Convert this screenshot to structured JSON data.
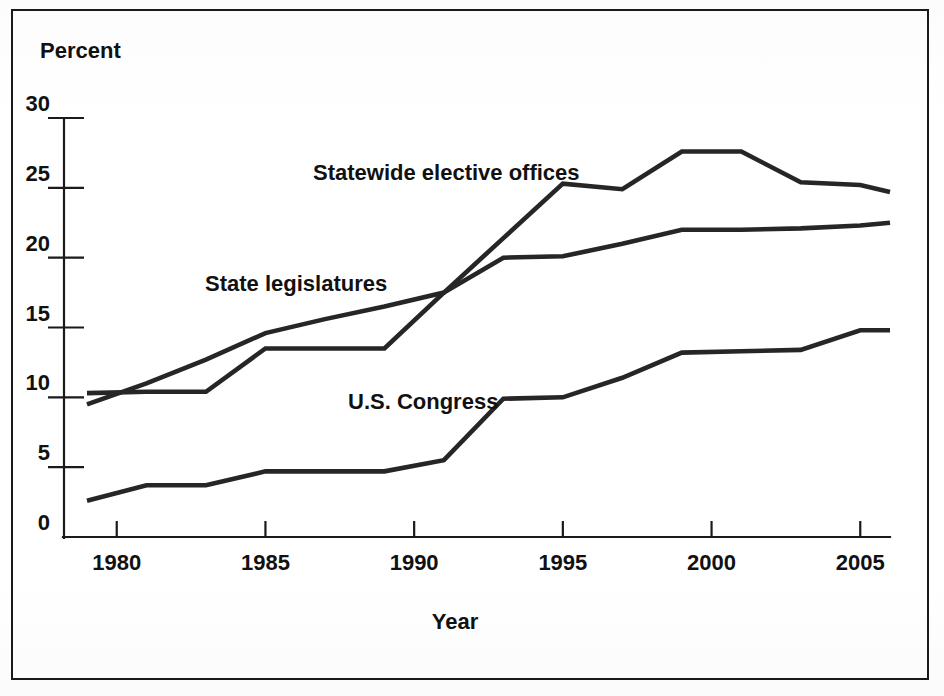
{
  "figure": {
    "y_axis_title": "Percent",
    "x_axis_title": "Year",
    "border_color": "#1a1a1a",
    "line_color": "#262626",
    "background_color": "#ffffff"
  },
  "y_ticks": [
    "0",
    "5",
    "10",
    "15",
    "20",
    "25",
    "30"
  ],
  "x_ticks": [
    "1980",
    "1985",
    "1990",
    "1995",
    "2000",
    "2005"
  ],
  "series_labels": {
    "statewide": "Statewide elective offices",
    "legislatures": "State legislatures",
    "congress": "U.S. Congress"
  },
  "chart_data": {
    "type": "line",
    "title": "",
    "subtitle": "",
    "xlabel": "Year",
    "ylabel": "Percent",
    "xlim": [
      1979,
      2006
    ],
    "ylim": [
      0,
      30
    ],
    "xticks": [
      1980,
      1985,
      1990,
      1995,
      2000,
      2005
    ],
    "yticks": [
      0,
      5,
      10,
      15,
      20,
      25,
      30
    ],
    "grid": false,
    "legend": "inline-annotations",
    "series": [
      {
        "name": "Statewide elective offices",
        "x": [
          1979,
          1981,
          1983,
          1985,
          1987,
          1989,
          1991,
          1993,
          1995,
          1997,
          1999,
          2001,
          2003,
          2005,
          2006
        ],
        "values": [
          9.5,
          11.0,
          12.7,
          14.6,
          15.6,
          16.5,
          17.5,
          21.4,
          25.3,
          24.9,
          27.6,
          27.6,
          25.4,
          25.2,
          24.7
        ]
      },
      {
        "name": "State legislatures",
        "x": [
          1979,
          1981,
          1983,
          1985,
          1987,
          1989,
          1991,
          1993,
          1995,
          1997,
          1999,
          2001,
          2003,
          2005,
          2006
        ],
        "values": [
          10.3,
          10.4,
          10.4,
          13.5,
          13.5,
          13.5,
          17.5,
          20.0,
          20.1,
          21.0,
          22.0,
          22.0,
          22.1,
          22.3,
          22.5
        ]
      },
      {
        "name": "U.S. Congress",
        "x": [
          1979,
          1981,
          1983,
          1985,
          1987,
          1989,
          1991,
          1993,
          1995,
          1997,
          1999,
          2001,
          2003,
          2005,
          2006
        ],
        "values": [
          2.6,
          3.7,
          3.7,
          4.7,
          4.7,
          4.7,
          5.5,
          9.9,
          10.0,
          11.4,
          13.2,
          13.3,
          13.4,
          14.8,
          14.8
        ]
      }
    ]
  }
}
